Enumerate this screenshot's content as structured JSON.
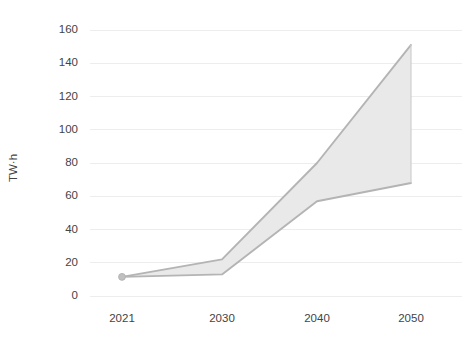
{
  "chart_data": {
    "type": "area",
    "title": "",
    "subtitle": "",
    "xlabel": "",
    "ylabel": "TW·h",
    "x": [
      2021,
      2030,
      2040,
      2050
    ],
    "categories": [
      "2021",
      "2030",
      "2040",
      "2050"
    ],
    "xtick_labels": [
      "2021",
      "2030",
      "2040",
      "2050"
    ],
    "ytick_labels": [
      "0",
      "20",
      "40",
      "60",
      "80",
      "100",
      "120",
      "140",
      "160"
    ],
    "yticks": [
      0,
      20,
      40,
      60,
      80,
      100,
      120,
      140,
      160
    ],
    "ylim": [
      0,
      168
    ],
    "xlim": [
      2021,
      2050
    ],
    "grid": "horizontal",
    "legend": "none",
    "series": [
      {
        "name": "High range",
        "values": [
          11.5,
          22,
          80,
          151
        ]
      },
      {
        "name": "Low range",
        "values": [
          11.5,
          13,
          57,
          68
        ]
      }
    ],
    "band": {
      "upper": [
        11.5,
        22,
        80,
        151
      ],
      "lower": [
        11.5,
        13,
        57,
        68
      ]
    },
    "markers": [
      {
        "x": 2021,
        "y": 11.5
      }
    ],
    "colors": {
      "band_fill": "#e9e9e9",
      "band_edge": "#b4b4b4",
      "gridline": "#ededed",
      "text": "#444444",
      "background": "#ffffff"
    }
  },
  "axes": {
    "y_title": "TW·h",
    "y_labels": [
      "160",
      "140",
      "120",
      "100",
      "80",
      "60",
      "40",
      "20",
      "0"
    ],
    "x_labels": [
      "2021",
      "2030",
      "2040",
      "2050"
    ]
  }
}
